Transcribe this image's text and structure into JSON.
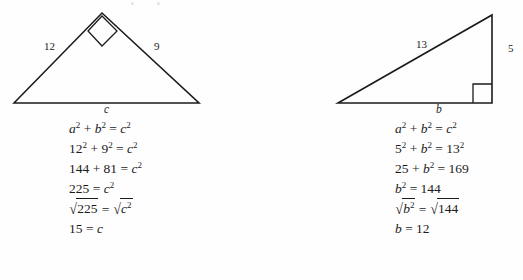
{
  "page": {
    "background_color": "#fefefe",
    "ink_color": "#1b1b1b"
  },
  "examples": [
    {
      "id": "left-example",
      "figure": {
        "name": "triangle-left",
        "shape": "triangle",
        "right_angle_at": "apex",
        "right_angle_marker": "square",
        "vertices": [
          [
            14,
            103
          ],
          [
            102,
            13
          ],
          [
            199,
            103
          ]
        ],
        "labels": [
          {
            "name": "leg-label-12",
            "text": "12",
            "x": 44,
            "y": 46,
            "style": "number"
          },
          {
            "name": "leg-label-9",
            "text": "9",
            "x": 154,
            "y": 46,
            "style": "number"
          },
          {
            "name": "base-label-c",
            "text": "c",
            "x": 104,
            "y": 105,
            "style": "variable"
          }
        ]
      },
      "equations": [
        {
          "type": "plain",
          "parts": [
            {
              "t": "a",
              "k": "v"
            },
            {
              "t": "2",
              "k": "sup"
            },
            {
              "t": " + ",
              "k": "op"
            },
            {
              "t": "b",
              "k": "v"
            },
            {
              "t": "2",
              "k": "sup"
            },
            {
              "t": " = ",
              "k": "op"
            },
            {
              "t": "c",
              "k": "v"
            },
            {
              "t": "2",
              "k": "sup"
            }
          ],
          "plain": "a² + b² = c²"
        },
        {
          "type": "plain",
          "parts": [
            {
              "t": "12",
              "k": "op"
            },
            {
              "t": "2",
              "k": "sup"
            },
            {
              "t": " + ",
              "k": "op"
            },
            {
              "t": "9",
              "k": "op"
            },
            {
              "t": "2",
              "k": "sup"
            },
            {
              "t": " = ",
              "k": "op"
            },
            {
              "t": "c",
              "k": "v"
            },
            {
              "t": "2",
              "k": "sup"
            }
          ],
          "plain": "12² + 9² = c²"
        },
        {
          "type": "plain",
          "parts": [
            {
              "t": "144 + 81 = ",
              "k": "op"
            },
            {
              "t": "c",
              "k": "v"
            },
            {
              "t": "2",
              "k": "sup"
            }
          ],
          "plain": "144 + 81 = c²"
        },
        {
          "type": "plain",
          "parts": [
            {
              "t": "225 = ",
              "k": "op"
            },
            {
              "t": "c",
              "k": "v"
            },
            {
              "t": "2",
              "k": "sup"
            }
          ],
          "plain": "225 = c²"
        },
        {
          "type": "radical",
          "left_radicand": "225",
          "right_radicand": "c²",
          "plain": "√225 = √c²"
        },
        {
          "type": "plain",
          "parts": [
            {
              "t": "15 = ",
              "k": "op"
            },
            {
              "t": "c",
              "k": "v"
            }
          ],
          "plain": "15 = c"
        }
      ]
    },
    {
      "id": "right-example",
      "figure": {
        "name": "triangle-right",
        "shape": "triangle",
        "right_angle_at": "bottom-right",
        "right_angle_marker": "square",
        "vertices": [
          [
            76,
            103
          ],
          [
            230,
            15
          ],
          [
            230,
            103
          ]
        ],
        "labels": [
          {
            "name": "hypotenuse-label-13",
            "text": "13",
            "x": 154,
            "y": 44,
            "style": "number"
          },
          {
            "name": "leg-label-5",
            "text": "5",
            "x": 246,
            "y": 48,
            "style": "number"
          },
          {
            "name": "base-label-b",
            "text": "b",
            "x": 174,
            "y": 105,
            "style": "variable"
          }
        ]
      },
      "equations": [
        {
          "type": "plain",
          "parts": [
            {
              "t": "a",
              "k": "v"
            },
            {
              "t": "2",
              "k": "sup"
            },
            {
              "t": " + ",
              "k": "op"
            },
            {
              "t": "b",
              "k": "v"
            },
            {
              "t": "2",
              "k": "sup"
            },
            {
              "t": " = ",
              "k": "op"
            },
            {
              "t": "c",
              "k": "v"
            },
            {
              "t": "2",
              "k": "sup"
            }
          ],
          "plain": "a² + b² = c²"
        },
        {
          "type": "plain",
          "parts": [
            {
              "t": "5",
              "k": "op"
            },
            {
              "t": "2",
              "k": "sup"
            },
            {
              "t": " + ",
              "k": "op"
            },
            {
              "t": "b",
              "k": "v"
            },
            {
              "t": "2",
              "k": "sup"
            },
            {
              "t": " = ",
              "k": "op"
            },
            {
              "t": "13",
              "k": "op"
            },
            {
              "t": "2",
              "k": "sup"
            }
          ],
          "plain": "5² + b² = 13²"
        },
        {
          "type": "plain",
          "parts": [
            {
              "t": "25 + ",
              "k": "op"
            },
            {
              "t": "b",
              "k": "v"
            },
            {
              "t": "2",
              "k": "sup"
            },
            {
              "t": " = 169",
              "k": "op"
            }
          ],
          "plain": "25 + b² = 169"
        },
        {
          "type": "plain",
          "parts": [
            {
              "t": "b",
              "k": "v"
            },
            {
              "t": "2",
              "k": "sup"
            },
            {
              "t": " = 144",
              "k": "op"
            }
          ],
          "plain": "b² = 144"
        },
        {
          "type": "radical",
          "left_radicand": "b²",
          "right_radicand": "144",
          "plain": "√b² = √144"
        },
        {
          "type": "plain",
          "parts": [
            {
              "t": "b",
              "k": "v"
            },
            {
              "t": " = 12",
              "k": "op"
            }
          ],
          "plain": "b = 12"
        }
      ]
    }
  ]
}
